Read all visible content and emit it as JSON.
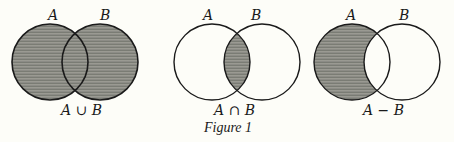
{
  "figure": {
    "caption": "Figure 1",
    "colors": {
      "fill": "#8a8a84",
      "stroke": "#1a1a1a",
      "background": "#fdfdf8"
    },
    "diagrams": [
      {
        "label_a": "A",
        "label_b": "B",
        "operation": "A ∪ B",
        "shaded": "union"
      },
      {
        "label_a": "A",
        "label_b": "B",
        "operation": "A ∩ B",
        "shaded": "intersection"
      },
      {
        "label_a": "A",
        "label_b": "B",
        "operation": "A − B",
        "shaded": "difference"
      }
    ]
  }
}
